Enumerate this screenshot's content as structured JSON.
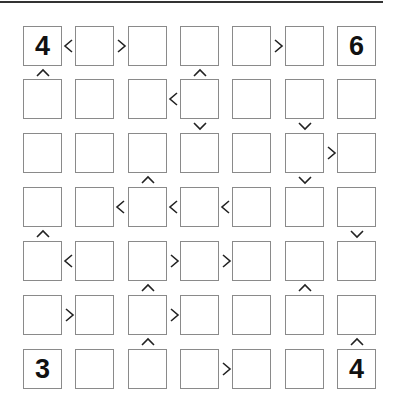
{
  "puzzle": {
    "type": "futoshiki",
    "size": 7,
    "grid": [
      [
        "4",
        "",
        "",
        "",
        "",
        "",
        "6"
      ],
      [
        "",
        "",
        "",
        "",
        "",
        "",
        ""
      ],
      [
        "",
        "",
        "",
        "",
        "",
        "",
        ""
      ],
      [
        "",
        "",
        "",
        "",
        "",
        "",
        ""
      ],
      [
        "",
        "",
        "",
        "",
        "",
        "",
        ""
      ],
      [
        "",
        "",
        "",
        "",
        "",
        "",
        ""
      ],
      [
        "3",
        "",
        "",
        "",
        "",
        "",
        "4"
      ]
    ],
    "horizontal_constraints": [
      {
        "row": 0,
        "col": 0,
        "sign": "<"
      },
      {
        "row": 0,
        "col": 1,
        "sign": ">"
      },
      {
        "row": 0,
        "col": 4,
        "sign": ">"
      },
      {
        "row": 1,
        "col": 2,
        "sign": "<"
      },
      {
        "row": 2,
        "col": 5,
        "sign": ">"
      },
      {
        "row": 3,
        "col": 1,
        "sign": "<"
      },
      {
        "row": 3,
        "col": 2,
        "sign": "<"
      },
      {
        "row": 3,
        "col": 3,
        "sign": "<"
      },
      {
        "row": 4,
        "col": 0,
        "sign": "<"
      },
      {
        "row": 4,
        "col": 2,
        "sign": ">"
      },
      {
        "row": 4,
        "col": 3,
        "sign": ">"
      },
      {
        "row": 5,
        "col": 0,
        "sign": ">"
      },
      {
        "row": 5,
        "col": 2,
        "sign": ">"
      },
      {
        "row": 6,
        "col": 3,
        "sign": ">"
      }
    ],
    "vertical_constraints": [
      {
        "row": 0,
        "col": 0,
        "sign": "^"
      },
      {
        "row": 0,
        "col": 3,
        "sign": "^"
      },
      {
        "row": 1,
        "col": 3,
        "sign": "v"
      },
      {
        "row": 1,
        "col": 5,
        "sign": "v"
      },
      {
        "row": 2,
        "col": 2,
        "sign": "^"
      },
      {
        "row": 2,
        "col": 5,
        "sign": "v"
      },
      {
        "row": 3,
        "col": 0,
        "sign": "^"
      },
      {
        "row": 3,
        "col": 6,
        "sign": "v"
      },
      {
        "row": 4,
        "col": 2,
        "sign": "^"
      },
      {
        "row": 4,
        "col": 5,
        "sign": "^"
      },
      {
        "row": 5,
        "col": 2,
        "sign": "^"
      },
      {
        "row": 5,
        "col": 6,
        "sign": "^"
      }
    ]
  },
  "colors": {
    "cell_border": "#8a8a8a",
    "digit": "#111111",
    "sign": "#222222",
    "top_rule": "#333333"
  }
}
